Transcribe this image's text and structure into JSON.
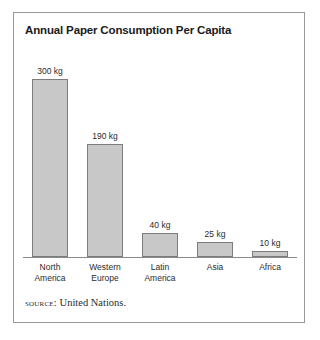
{
  "figure": {
    "title": "Annual Paper Consumption Per Capita",
    "source_label": "source:",
    "source_text": "United Nations.",
    "frame_color": "#999999",
    "bar_fill_color": "#c8c8c8",
    "bar_border_color": "#7c7c7c",
    "axis_color": "#8a8a8a",
    "text_color": "#2b2b2b"
  },
  "chart_data": {
    "type": "bar",
    "title": "Annual Paper Consumption Per Capita",
    "xlabel": "",
    "ylabel": "",
    "unit": "kg",
    "categories": [
      "North America",
      "Western Europe",
      "Latin America",
      "Asia",
      "Africa"
    ],
    "category_lines": [
      [
        "North",
        "America"
      ],
      [
        "Western",
        "Europe"
      ],
      [
        "Latin",
        "America"
      ],
      [
        "Asia"
      ],
      [
        "Africa"
      ]
    ],
    "values": [
      300,
      190,
      40,
      25,
      10
    ],
    "data_labels": [
      "300 kg",
      "190 kg",
      "40 kg",
      "25 kg",
      "10 kg"
    ],
    "ylim": [
      0,
      300
    ],
    "grid": false,
    "legend": false,
    "axis_visible": "x-only",
    "source": "source: United Nations."
  }
}
